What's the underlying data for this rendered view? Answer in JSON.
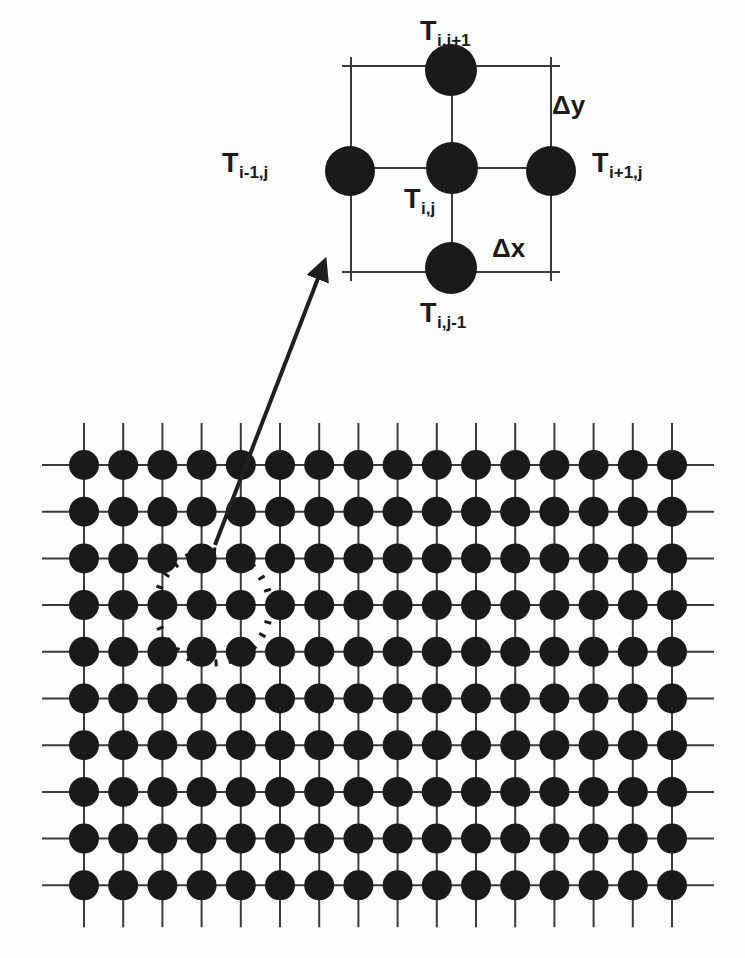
{
  "figure": {
    "type": "diagram",
    "background_color": "#fdfdfd",
    "ink_color": "#1a1a1a",
    "line_color": "#3a3a3a"
  },
  "inset": {
    "name": "five-point-stencil",
    "box": {
      "x1": 351,
      "y1": 66,
      "x2": 551,
      "y2": 272
    },
    "nodes": [
      {
        "id": "center",
        "label_key": "center",
        "cx": 452,
        "cy": 168,
        "r": 26
      },
      {
        "id": "north",
        "label_key": "north",
        "cx": 451,
        "cy": 70,
        "r": 26
      },
      {
        "id": "south",
        "label_key": "south",
        "cx": 451,
        "cy": 268,
        "r": 26
      },
      {
        "id": "west",
        "label_key": "west",
        "cx": 350,
        "cy": 171,
        "r": 25
      },
      {
        "id": "east",
        "label_key": "east",
        "cx": 551,
        "cy": 171,
        "r": 25
      }
    ],
    "labels": {
      "north": {
        "base": "T",
        "sub": "i,j+1",
        "x": 420,
        "y": 18
      },
      "south": {
        "base": "T",
        "sub": "i,j-1",
        "x": 420,
        "y": 300
      },
      "west": {
        "base": "T",
        "sub": "i-1,j",
        "x": 222,
        "y": 150
      },
      "east": {
        "base": "T",
        "sub": "i+1,j",
        "x": 592,
        "y": 150
      },
      "center": {
        "base": "T",
        "sub": "i,j",
        "x": 404,
        "y": 186
      }
    },
    "spacing_labels": {
      "dy": {
        "text": "Δy",
        "x": 552,
        "y": 92
      },
      "dx": {
        "text": "Δx",
        "x": 492,
        "y": 235
      }
    }
  },
  "main_grid": {
    "name": "computational-mesh",
    "columns": 16,
    "rows": 10,
    "origin": {
      "x": 84,
      "y": 465
    },
    "spacing": {
      "dx": 39.2,
      "dy": 46.7
    },
    "node_radius": 15,
    "stub_length": 42
  },
  "callout": {
    "dotted_circle": {
      "cx": 213,
      "cy": 607,
      "rx": 57,
      "ry": 56,
      "dash": "3 11",
      "stroke_width": 7
    },
    "arrow": {
      "x1": 215,
      "y1": 545,
      "x2": 322,
      "y2": 268,
      "stroke_width": 4,
      "head_size": 17
    }
  }
}
